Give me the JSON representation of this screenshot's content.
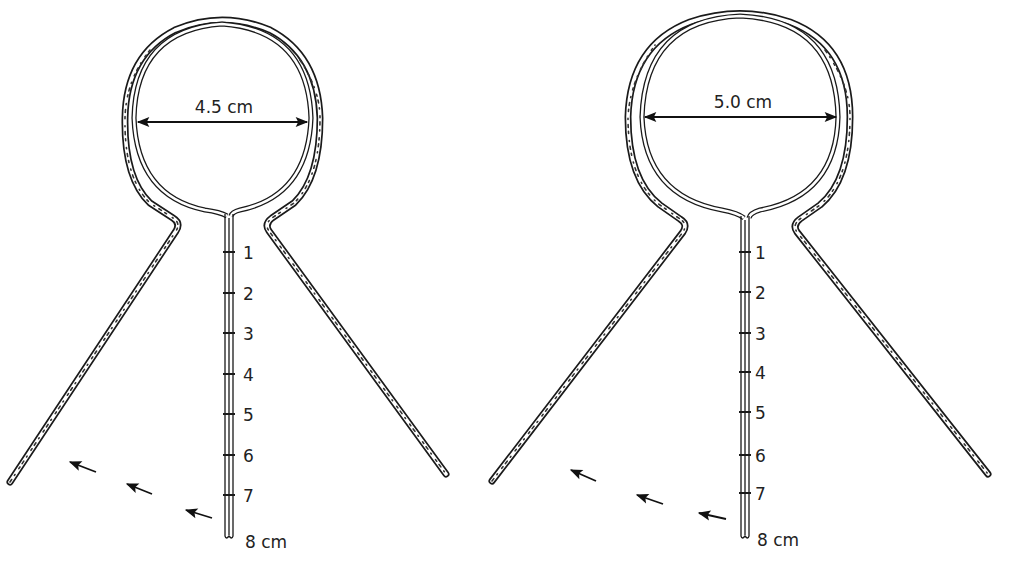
{
  "figures": [
    {
      "id": "small",
      "diameter_label": "4.5 cm",
      "scale_labels": [
        "1",
        "2",
        "3",
        "4",
        "5",
        "6",
        "7",
        "8 cm"
      ]
    },
    {
      "id": "large",
      "diameter_label": "5.0 cm",
      "scale_labels": [
        "1",
        "2",
        "3",
        "4",
        "5",
        "6",
        "7",
        "8 cm"
      ]
    }
  ],
  "colors": {
    "line": "#1a1a1a",
    "background": "#ffffff"
  }
}
